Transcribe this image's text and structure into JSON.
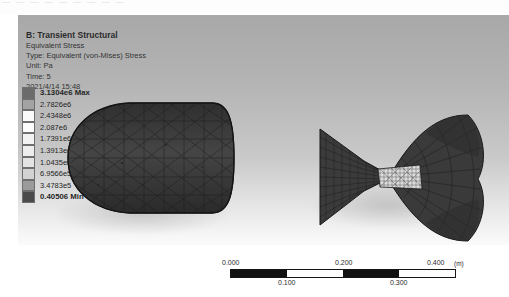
{
  "top_strip": {
    "ghost_text": "— — —  —  — — —   —  —"
  },
  "legend_header": {
    "title": "B: Transient Structural",
    "lines": [
      "Equivalent Stress",
      "Type: Equivalent (von-Mises) Stress",
      "Unit: Pa",
      "Time: 5",
      "2021/4/14 15:48"
    ]
  },
  "legend_scale": {
    "max_label": "3.1304e6 Max",
    "min_label": "0.40506 Min",
    "bands": [
      {
        "value": "3.1304e6 Max",
        "color": "#6b6b6b",
        "bold": true
      },
      {
        "value": "2.7826e6",
        "color": "#a3a3a3",
        "bold": false
      },
      {
        "value": "2.4348e6",
        "color": "#fbfbfb",
        "bold": false
      },
      {
        "value": "2.087e6",
        "color": "#fdfdfd",
        "bold": false
      },
      {
        "value": "1.7391e6",
        "color": "#f2f2f2",
        "bold": false
      },
      {
        "value": "1.3913e6",
        "color": "#ededed",
        "bold": false
      },
      {
        "value": "1.0435e6",
        "color": "#e3e3e3",
        "bold": false
      },
      {
        "value": "6.9566e5",
        "color": "#d2d2d2",
        "bold": false
      },
      {
        "value": "3.4783e5",
        "color": "#9b9b9b",
        "bold": false
      },
      {
        "value": "0.40506 Min",
        "color": "#4a4a4a",
        "bold": true
      }
    ]
  },
  "geometry": {
    "body_name": "fish-body-pod-mesh",
    "tail_name": "fish-caudal-fin-mesh",
    "mesh_color": "#3a3a3a",
    "mesh_edge_color": "#1d1d1d",
    "hotspot_color": "#e9e9e9"
  },
  "scale_bar": {
    "unit": "(m)",
    "top_ticks": [
      "0.000",
      "0.200",
      "0.400"
    ],
    "bottom_ticks": [
      "0.100",
      "0.300"
    ],
    "segments": [
      "dark",
      "light",
      "dark",
      "light"
    ]
  }
}
